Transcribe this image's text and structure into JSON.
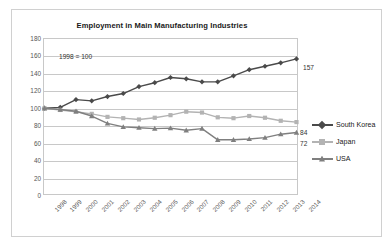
{
  "chart": {
    "title": "Employment in Main Manufacturing Industries",
    "annotation": "1998 = 100"
  },
  "axes": {
    "y_ticks": [
      "180",
      "160",
      "140",
      "120",
      "100",
      "80",
      "60",
      "40",
      "20",
      "0"
    ],
    "x_ticks": [
      "1998",
      "1999",
      "2000",
      "2001",
      "2002",
      "2003",
      "2004",
      "2005",
      "2006",
      "2007",
      "2008",
      "2009",
      "2010",
      "2011",
      "2012",
      "2013",
      "2014"
    ]
  },
  "legend": {
    "items": [
      {
        "label": "South Korea",
        "color": "#4a4a4a",
        "marker": "diamond"
      },
      {
        "label": "Japan",
        "color": "#b3b3b3",
        "marker": "square"
      },
      {
        "label": "USA",
        "color": "#7f7f7f",
        "marker": "triangle"
      }
    ]
  },
  "end_labels": {
    "south_korea": "157",
    "japan": "84",
    "usa": "72"
  },
  "chart_data": {
    "type": "line",
    "title": "Employment in Main Manufacturing Industries",
    "subtitle": "1998 = 100",
    "xlabel": "",
    "ylabel": "",
    "ylim": [
      0,
      180
    ],
    "ytick_step": 20,
    "grid": true,
    "legend_position": "right",
    "annotations": [
      {
        "text": "1998 = 100",
        "x": "1999",
        "y": 162
      },
      {
        "text": "157",
        "x": "2014",
        "y": 157
      },
      {
        "text": "84",
        "x": "2014",
        "y": 84
      },
      {
        "text": "72",
        "x": "2014",
        "y": 72
      }
    ],
    "categories": [
      "1998",
      "1999",
      "2000",
      "2001",
      "2002",
      "2003",
      "2004",
      "2005",
      "2006",
      "2007",
      "2008",
      "2009",
      "2010",
      "2011",
      "2012",
      "2013",
      "2014"
    ],
    "series": [
      {
        "name": "South Korea",
        "color": "#4a4a4a",
        "marker": "diamond",
        "values": [
          100,
          101,
          110,
          108.5,
          113.5,
          117,
          125,
          129.5,
          135.5,
          134,
          130.5,
          130.5,
          137.5,
          144.5,
          148.5,
          152.5,
          157
        ]
      },
      {
        "name": "Japan",
        "color": "#b3b3b3",
        "marker": "square",
        "values": [
          100,
          98,
          96,
          93.5,
          90,
          88.5,
          87,
          89,
          92,
          96,
          95,
          89.5,
          88.5,
          91,
          89,
          85.5,
          84
        ]
      },
      {
        "name": "USA",
        "color": "#7f7f7f",
        "marker": "triangle",
        "values": [
          100,
          98.5,
          96.5,
          91,
          82.5,
          78.5,
          77.5,
          76.5,
          77,
          74.5,
          76.5,
          63.5,
          63.5,
          64.5,
          66,
          70,
          72
        ]
      }
    ]
  }
}
